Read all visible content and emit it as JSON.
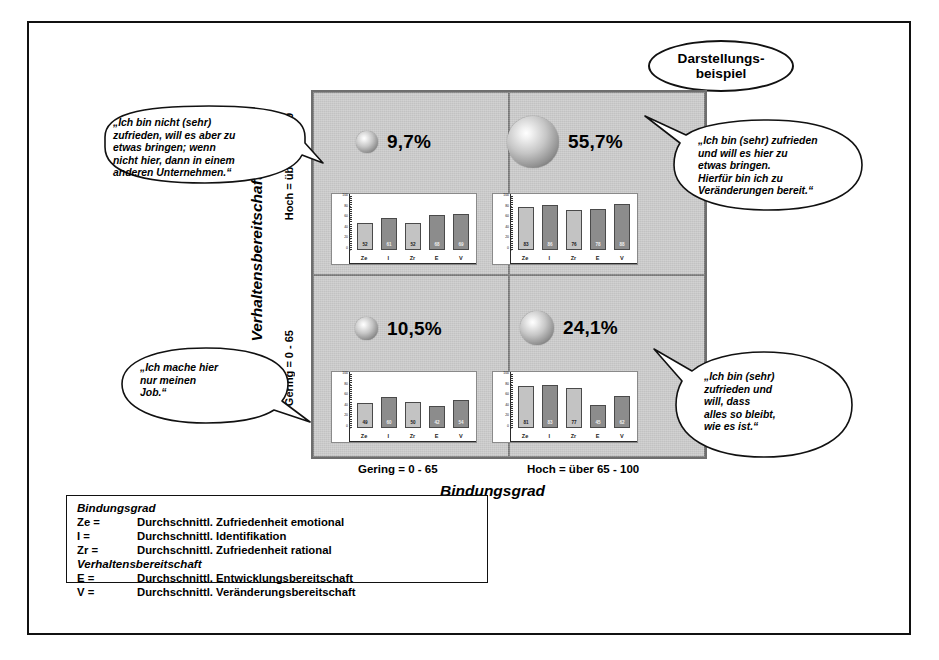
{
  "badge": {
    "line1": "Darstellungs-",
    "line2": "beispiel"
  },
  "axes": {
    "y_title": "Verhaltensbereitschaft",
    "y_high": "Hoch = über 65 - 100",
    "y_low": "Gering = 0 - 65",
    "x_title": "Bindungsgrad",
    "x_low": "Gering = 0 - 65",
    "x_high": "Hoch = über 65 - 100"
  },
  "quadrants": [
    {
      "id": "top-left",
      "percent": "9,7%",
      "sphere_size": 22,
      "callout": "„Ich bin nicht (sehr)\n zufrieden, will es aber zu\netwas bringen; wenn\nnicht hier, dann in einem\nanderen Unternehmen.“"
    },
    {
      "id": "top-right",
      "percent": "55,7%",
      "sphere_size": 52,
      "callout": "„Ich bin (sehr) zufrieden\nund will es hier zu\netwas bringen.\nHierfür bin ich zu\nVeränderungen bereit.“"
    },
    {
      "id": "bottom-left",
      "percent": "10,5%",
      "sphere_size": 23,
      "callout": "„Ich mache hier\nnur meinen\nJob.“"
    },
    {
      "id": "bottom-right",
      "percent": "24,1%",
      "sphere_size": 34,
      "callout": "„Ich bin (sehr)\nzufrieden und\nwill, dass\nalles so bleibt,\nwie es ist.“"
    }
  ],
  "chart_data": [
    {
      "type": "bar",
      "title": "Quadrant oben links (9,7%)",
      "categories": [
        "Ze",
        "I",
        "Zr",
        "E",
        "V"
      ],
      "values": [
        52,
        61,
        52,
        68,
        69
      ],
      "ylim": [
        0,
        100
      ],
      "yticks": [
        0,
        20,
        40,
        60,
        80,
        100
      ],
      "ylabel": "",
      "xlabel": "",
      "grid": false,
      "legend": "none",
      "bar_styles": [
        "light",
        "dark",
        "light",
        "dark",
        "dark"
      ]
    },
    {
      "type": "bar",
      "title": "Quadrant oben rechts (55,7%)",
      "categories": [
        "Ze",
        "I",
        "Zr",
        "E",
        "V"
      ],
      "values": [
        83,
        86,
        76,
        78,
        88
      ],
      "ylim": [
        0,
        100
      ],
      "yticks": [
        0,
        20,
        40,
        60,
        80,
        100
      ],
      "ylabel": "",
      "xlabel": "",
      "grid": false,
      "legend": "none",
      "bar_styles": [
        "light",
        "dark",
        "light",
        "dark",
        "dark"
      ]
    },
    {
      "type": "bar",
      "title": "Quadrant unten links (10,5%)",
      "categories": [
        "Ze",
        "I",
        "Zr",
        "E",
        "V"
      ],
      "values": [
        49,
        60,
        50,
        42,
        54
      ],
      "ylim": [
        0,
        100
      ],
      "yticks": [
        0,
        20,
        40,
        60,
        80,
        100
      ],
      "ylabel": "",
      "xlabel": "",
      "grid": false,
      "legend": "none",
      "bar_styles": [
        "light",
        "dark",
        "light",
        "dark",
        "dark"
      ]
    },
    {
      "type": "bar",
      "title": "Quadrant unten rechts (24,1%)",
      "categories": [
        "Ze",
        "I",
        "Zr",
        "E",
        "V"
      ],
      "values": [
        81,
        83,
        77,
        45,
        62
      ],
      "ylim": [
        0,
        100
      ],
      "yticks": [
        0,
        20,
        40,
        60,
        80,
        100
      ],
      "ylabel": "",
      "xlabel": "",
      "grid": false,
      "legend": "none",
      "bar_styles": [
        "light",
        "dark",
        "light",
        "dark",
        "dark"
      ]
    }
  ],
  "legend": {
    "group1": "Bindungsgrad",
    "group2": "Verhaltensbereitschaft",
    "rows1": [
      {
        "key": "Ze  =",
        "desc": "Durchschnittl. Zufriedenheit emotional"
      },
      {
        "key": "I    =",
        "desc": "Durchschnittl. Identifikation"
      },
      {
        "key": "Zr =",
        "desc": "Durchschnittl. Zufriedenheit rational"
      }
    ],
    "rows2": [
      {
        "key": "E  =",
        "desc": "Durchschnittl. Entwicklungsbereitschaft"
      },
      {
        "key": "V  =",
        "desc": "Durchschnittl. Veränderungsbereitschaft"
      }
    ]
  },
  "colors": {
    "frame": "#111111",
    "matrix_bg": "#c9c9c9",
    "bar_light": "#c3c3c3",
    "bar_dark": "#8c8c8c",
    "chart_bg": "#ffffff"
  }
}
